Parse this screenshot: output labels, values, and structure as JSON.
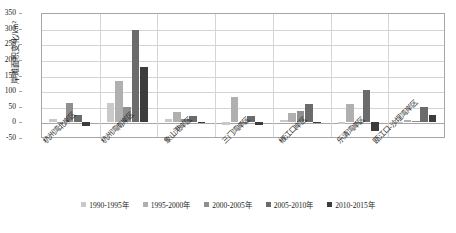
{
  "chart_data": {
    "type": "bar",
    "title": "",
    "xlabel": "",
    "ylabel": "岸滩面积变化/km²",
    "ylim": [
      -50,
      350
    ],
    "ytick_labels": [
      "350",
      "300",
      "250",
      "200",
      "150",
      "100",
      "50",
      "0",
      "-50"
    ],
    "yticks": [
      350,
      300,
      250,
      200,
      150,
      100,
      50,
      0,
      -50
    ],
    "grid": true,
    "legend_position": "bottom",
    "categories": [
      "杭州湾北岸区",
      "杭州湾南岸区",
      "象山港岸区",
      "三门湾岸区",
      "椒江口岸区",
      "乐清湾岸区",
      "瓯江口-沙埕湾岸区"
    ],
    "series": [
      {
        "name": "1990-1995年",
        "color": "#c9c9c9",
        "values": [
          12,
          62,
          11,
          -9,
          7,
          -4,
          -3
        ]
      },
      {
        "name": "1995-2000年",
        "color": "#b0b0b0",
        "values": [
          1,
          132,
          32,
          81,
          31,
          60,
          9
        ]
      },
      {
        "name": "2000-2005年",
        "color": "#8f8f8f",
        "values": [
          63,
          48,
          10,
          2,
          35,
          1,
          3
        ]
      },
      {
        "name": "2005-2010年",
        "color": "#6b6b6b",
        "values": [
          23,
          296,
          20,
          19,
          58,
          105,
          50
        ]
      },
      {
        "name": "2010-2015年",
        "color": "#3c3c3c",
        "values": [
          -12,
          176,
          2,
          -7,
          1,
          -29,
          25
        ]
      }
    ]
  },
  "legend": {
    "items": [
      {
        "label": "1990-1995年",
        "color": "#c9c9c9"
      },
      {
        "label": "1995-2000年",
        "color": "#b0b0b0"
      },
      {
        "label": "2000-2005年",
        "color": "#8f8f8f"
      },
      {
        "label": "2005-2010年",
        "color": "#6b6b6b"
      },
      {
        "label": "2010-2015年",
        "color": "#3c3c3c"
      }
    ]
  }
}
